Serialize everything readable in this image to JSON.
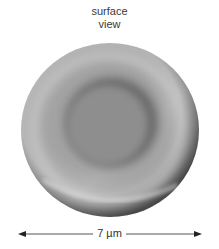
{
  "caption": {
    "line1": "surface",
    "line2": "view"
  },
  "figure": {
    "view": "surface view",
    "colors": {
      "rim_light": "#c8c8c8",
      "body": "#9a9a9a",
      "center_dark": "#5a5a5a",
      "edge_dark": "#4a4a4a"
    }
  },
  "scale_bar": {
    "label": "7 µm",
    "color": "#333333"
  }
}
